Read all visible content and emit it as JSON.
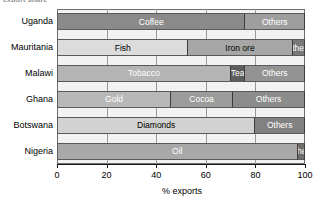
{
  "top_caption": "export share",
  "chart_data": {
    "type": "bar",
    "orientation": "horizontal",
    "stacked": true,
    "title": "",
    "xlabel": "% exports",
    "ylabel": "",
    "xlim": [
      0,
      100
    ],
    "xticks": [
      0,
      20,
      40,
      60,
      80,
      100
    ],
    "xtick_labels": [
      "0",
      "20",
      "40",
      "60",
      "80",
      "100"
    ],
    "grid": true,
    "legend": "none",
    "categories": [
      "Uganda",
      "Mauritania",
      "Malawi",
      "Ghana",
      "Botswana",
      "Nigeria"
    ],
    "rows": [
      {
        "category": "Uganda",
        "segments": [
          {
            "label": "Coffee",
            "value": 76,
            "start": 0,
            "end": 76,
            "color": "#8a8a8a",
            "text_color": "#ffffff"
          },
          {
            "label": "Others",
            "value": 24,
            "start": 76,
            "end": 100,
            "color": "#9e9e9e",
            "text_color": "#ffffff"
          }
        ]
      },
      {
        "category": "Mauritania",
        "segments": [
          {
            "label": "Fish",
            "value": 53,
            "start": 0,
            "end": 53,
            "color": "#dcdcdc",
            "text_color": "#000000"
          },
          {
            "label": "Iron ore",
            "value": 42,
            "start": 53,
            "end": 95,
            "color": "#a6a6a6",
            "text_color": "#000000"
          },
          {
            "label": "Others",
            "value": 5,
            "start": 95,
            "end": 100,
            "color": "#787878",
            "text_color": "#ffffff"
          }
        ]
      },
      {
        "category": "Malawi",
        "segments": [
          {
            "label": "Tobacco",
            "value": 70,
            "start": 0,
            "end": 70,
            "color": "#b4b4b4",
            "text_color": "#ffffff"
          },
          {
            "label": "Tea",
            "value": 6,
            "start": 70,
            "end": 76,
            "color": "#5e5e5e",
            "text_color": "#ffffff"
          },
          {
            "label": "Others",
            "value": 24,
            "start": 76,
            "end": 100,
            "color": "#939393",
            "text_color": "#ffffff"
          }
        ]
      },
      {
        "category": "Ghana",
        "segments": [
          {
            "label": "Gold",
            "value": 46,
            "start": 0,
            "end": 46,
            "color": "#b8b8b8",
            "text_color": "#ffffff"
          },
          {
            "label": "Cocoa",
            "value": 25,
            "start": 46,
            "end": 71,
            "color": "#9c9c9c",
            "text_color": "#ffffff"
          },
          {
            "label": "Others",
            "value": 29,
            "start": 71,
            "end": 100,
            "color": "#8c8c8c",
            "text_color": "#ffffff"
          }
        ]
      },
      {
        "category": "Botswana",
        "segments": [
          {
            "label": "Diamonds",
            "value": 80,
            "start": 0,
            "end": 80,
            "color": "#d2d2d2",
            "text_color": "#000000"
          },
          {
            "label": "Others",
            "value": 20,
            "start": 80,
            "end": 100,
            "color": "#818181",
            "text_color": "#ffffff"
          }
        ]
      },
      {
        "category": "Nigeria",
        "segments": [
          {
            "label": "Oil",
            "value": 97,
            "start": 0,
            "end": 97,
            "color": "#a9a9a9",
            "text_color": "#ffffff"
          },
          {
            "label": "Others",
            "value": 3,
            "start": 97,
            "end": 100,
            "color": "#6e6e6e",
            "text_color": "#ffffff"
          }
        ]
      }
    ]
  }
}
